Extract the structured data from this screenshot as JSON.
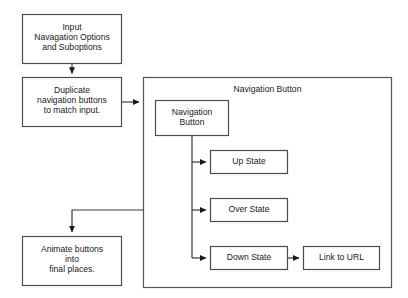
{
  "diagram": {
    "background_color": "#ffffff",
    "line_color": "#3a3a3a",
    "box_border_color": "#4d4d4d",
    "text_color": "#1a1a1a",
    "nodes": {
      "input": {
        "label": "Input\nNavagation Options\nand Suboptions"
      },
      "duplicate": {
        "label": "Duplicate\nnavigation buttons\nto match input."
      },
      "animate": {
        "label": "Animate buttons\ninto\nfinal places."
      },
      "container": {
        "label": "Navigation Button"
      },
      "nested_button": {
        "label": "Navigation\nButton"
      },
      "up_state": {
        "label": "Up State"
      },
      "over_state": {
        "label": "Over State"
      },
      "down_state": {
        "label": "Down State"
      },
      "link_to_url": {
        "label": "Link to URL"
      }
    },
    "connectors": [
      {
        "name": "input-to-duplicate",
        "from": "input",
        "to": "duplicate"
      },
      {
        "name": "duplicate-to-container",
        "from": "duplicate",
        "to": "container"
      },
      {
        "name": "nested-to-up-state",
        "from": "nested_button",
        "to": "up_state"
      },
      {
        "name": "nested-to-over-state",
        "from": "nested_button",
        "to": "over_state"
      },
      {
        "name": "nested-to-down-state",
        "from": "nested_button",
        "to": "down_state"
      },
      {
        "name": "down-state-to-link",
        "from": "down_state",
        "to": "link_to_url"
      },
      {
        "name": "container-to-animate",
        "from": "container",
        "to": "animate"
      }
    ]
  }
}
